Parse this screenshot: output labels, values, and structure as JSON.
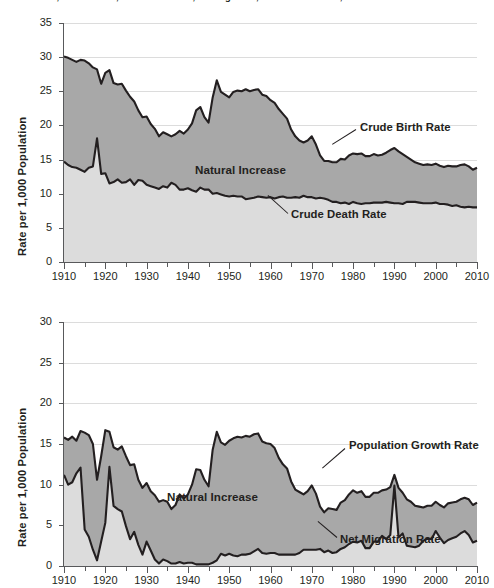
{
  "figure": {
    "title": "Crude Birth, Crude Death, Natural Increase, Net Migration, and Growth Rates, 1910–2010"
  },
  "panels": [
    {
      "id": "top",
      "ylabel": "Rate per 1,000 Population",
      "yticks": [
        "0",
        "5",
        "10",
        "15",
        "20",
        "25",
        "30",
        "35"
      ],
      "xticks": [
        "1910",
        "1920",
        "1930",
        "1940",
        "1950",
        "1960",
        "1970",
        "1980",
        "1990",
        "2000",
        "2010"
      ],
      "annotations": [
        {
          "name": "crude-birth-rate-label",
          "text": "Crude Birth Rate"
        },
        {
          "name": "natural-increase-label",
          "text": "Natural Increase"
        },
        {
          "name": "crude-death-rate-label",
          "text": "Crude Death Rate"
        }
      ]
    },
    {
      "id": "bottom",
      "ylabel": "Rate per 1,000 Population",
      "yticks": [
        "0",
        "5",
        "10",
        "15",
        "20",
        "25",
        "30"
      ],
      "xticks": [
        "1910",
        "1920",
        "1930",
        "1940",
        "1950",
        "1960",
        "1970",
        "1980",
        "1990",
        "2000",
        "2010"
      ],
      "annotations": [
        {
          "name": "population-growth-rate-label",
          "text": "Population Growth Rate"
        },
        {
          "name": "natural-increase-label",
          "text": "Natural Increase"
        },
        {
          "name": "net-migration-rate-label",
          "text": "Net Migration Rate"
        }
      ]
    }
  ],
  "colors": {
    "band_upper_fill": "#a8a8a8",
    "band_lower_fill": "#dcdcdc",
    "line": "#231f20",
    "grid": "#dcdcdc",
    "axis": "#58595b",
    "text": "#231f20"
  },
  "chart_data": [
    {
      "type": "area",
      "id": "top-panel",
      "title": "Crude Birth, Crude Death, Natural Increase, Net Migration, and Growth Rates, 1910–2010",
      "xlabel": "",
      "ylabel": "Rate per 1,000 Population",
      "xlim": [
        1910,
        2010
      ],
      "ylim": [
        0,
        35
      ],
      "ytick_step": 5,
      "xtick_step": 10,
      "xminor_tick_step": 5,
      "grid": true,
      "legend_position": "inline-annotations",
      "stacked": true,
      "shaded_regions": [
        {
          "name": "Natural Increase",
          "between": [
            "Crude Death Rate",
            "Crude Birth Rate"
          ],
          "fill": "#a8a8a8"
        },
        {
          "name": "Deaths",
          "between": [
            "zero",
            "Crude Death Rate"
          ],
          "fill": "#dcdcdc"
        }
      ],
      "x": [
        1910,
        1911,
        1912,
        1913,
        1914,
        1915,
        1916,
        1917,
        1918,
        1919,
        1920,
        1921,
        1922,
        1923,
        1924,
        1925,
        1926,
        1927,
        1928,
        1929,
        1930,
        1931,
        1932,
        1933,
        1934,
        1935,
        1936,
        1937,
        1938,
        1939,
        1940,
        1941,
        1942,
        1943,
        1944,
        1945,
        1946,
        1947,
        1948,
        1949,
        1950,
        1951,
        1952,
        1953,
        1954,
        1955,
        1956,
        1957,
        1958,
        1959,
        1960,
        1961,
        1962,
        1963,
        1964,
        1965,
        1966,
        1967,
        1968,
        1969,
        1970,
        1971,
        1972,
        1973,
        1974,
        1975,
        1976,
        1977,
        1978,
        1979,
        1980,
        1981,
        1982,
        1983,
        1984,
        1985,
        1986,
        1987,
        1988,
        1989,
        1990,
        1991,
        1992,
        1993,
        1994,
        1995,
        1996,
        1997,
        1998,
        1999,
        2000,
        2001,
        2002,
        2003,
        2004,
        2005,
        2006,
        2007,
        2008,
        2009,
        2010
      ],
      "series": [
        {
          "name": "Crude Birth Rate",
          "values": [
            30.1,
            29.9,
            29.6,
            29.3,
            29.6,
            29.5,
            29.1,
            28.5,
            28.2,
            26.1,
            27.7,
            28.1,
            26.2,
            26.0,
            26.1,
            25.1,
            24.2,
            23.5,
            22.2,
            21.2,
            21.3,
            20.2,
            19.5,
            18.4,
            19.0,
            18.7,
            18.4,
            18.7,
            19.2,
            18.8,
            19.4,
            20.3,
            22.2,
            22.7,
            21.2,
            20.4,
            24.1,
            26.6,
            24.9,
            24.5,
            24.1,
            24.9,
            25.1,
            25.0,
            25.3,
            25.0,
            25.2,
            25.3,
            24.5,
            24.3,
            23.7,
            23.3,
            22.4,
            21.7,
            21.0,
            19.4,
            18.4,
            17.8,
            17.5,
            17.8,
            18.4,
            17.2,
            15.6,
            14.8,
            14.8,
            14.6,
            14.6,
            15.1,
            15.0,
            15.6,
            15.9,
            15.8,
            15.9,
            15.5,
            15.5,
            15.8,
            15.6,
            15.7,
            16.0,
            16.4,
            16.7,
            16.2,
            15.8,
            15.4,
            15.0,
            14.6,
            14.4,
            14.2,
            14.3,
            14.2,
            14.4,
            14.1,
            13.9,
            14.1,
            14.0,
            14.0,
            14.2,
            14.3,
            14.0,
            13.5,
            13.8
          ]
        },
        {
          "name": "Crude Death Rate",
          "values": [
            14.7,
            14.2,
            13.9,
            13.8,
            13.5,
            13.2,
            13.8,
            14.0,
            18.1,
            12.9,
            13.0,
            11.5,
            11.7,
            12.1,
            11.6,
            11.7,
            12.1,
            11.3,
            12.0,
            11.9,
            11.3,
            11.1,
            10.9,
            10.7,
            11.1,
            10.9,
            11.6,
            11.3,
            10.6,
            10.6,
            10.8,
            10.5,
            10.3,
            10.9,
            10.6,
            10.6,
            10.0,
            10.1,
            9.9,
            9.7,
            9.6,
            9.7,
            9.6,
            9.6,
            9.2,
            9.3,
            9.4,
            9.6,
            9.5,
            9.4,
            9.5,
            9.3,
            9.5,
            9.6,
            9.4,
            9.4,
            9.5,
            9.4,
            9.7,
            9.5,
            9.5,
            9.3,
            9.4,
            9.3,
            9.1,
            8.8,
            8.8,
            8.6,
            8.7,
            8.5,
            8.8,
            8.6,
            8.5,
            8.6,
            8.6,
            8.7,
            8.7,
            8.7,
            8.8,
            8.7,
            8.6,
            8.6,
            8.5,
            8.8,
            8.8,
            8.8,
            8.7,
            8.6,
            8.6,
            8.6,
            8.7,
            8.5,
            8.5,
            8.4,
            8.2,
            8.3,
            8.1,
            8.0,
            8.1,
            8.0,
            8.0
          ]
        }
      ],
      "annotations": [
        {
          "text": "Crude Birth Rate",
          "at_year": 1985
        },
        {
          "text": "Natural Increase",
          "at_year": 1952
        },
        {
          "text": "Crude Death Rate",
          "at_year": 1984
        }
      ]
    },
    {
      "type": "area",
      "id": "bottom-panel",
      "title": "",
      "xlabel": "",
      "ylabel": "Rate per 1,000 Population",
      "xlim": [
        1910,
        2010
      ],
      "ylim": [
        0,
        30
      ],
      "ytick_step": 5,
      "xtick_step": 10,
      "xminor_tick_step": 5,
      "grid": true,
      "legend_position": "inline-annotations",
      "stacked": true,
      "shaded_regions": [
        {
          "name": "Natural Increase",
          "between": [
            "Net Migration Rate",
            "Population Growth Rate"
          ],
          "fill": "#a8a8a8"
        },
        {
          "name": "Net Migration",
          "between": [
            "zero",
            "Net Migration Rate"
          ],
          "fill": "#dcdcdc"
        }
      ],
      "x": [
        1910,
        1911,
        1912,
        1913,
        1914,
        1915,
        1916,
        1917,
        1918,
        1919,
        1920,
        1921,
        1922,
        1923,
        1924,
        1925,
        1926,
        1927,
        1928,
        1929,
        1930,
        1931,
        1932,
        1933,
        1934,
        1935,
        1936,
        1937,
        1938,
        1939,
        1940,
        1941,
        1942,
        1943,
        1944,
        1945,
        1946,
        1947,
        1948,
        1949,
        1950,
        1951,
        1952,
        1953,
        1954,
        1955,
        1956,
        1957,
        1958,
        1959,
        1960,
        1961,
        1962,
        1963,
        1964,
        1965,
        1966,
        1967,
        1968,
        1969,
        1970,
        1971,
        1972,
        1973,
        1974,
        1975,
        1976,
        1977,
        1978,
        1979,
        1980,
        1981,
        1982,
        1983,
        1984,
        1985,
        1986,
        1987,
        1988,
        1989,
        1990,
        1991,
        1992,
        1993,
        1994,
        1995,
        1996,
        1997,
        1998,
        1999,
        2000,
        2001,
        2002,
        2003,
        2004,
        2005,
        2006,
        2007,
        2008,
        2009,
        2010
      ],
      "series": [
        {
          "name": "Population Growth Rate",
          "values": [
            15.8,
            15.5,
            15.9,
            15.4,
            16.6,
            16.4,
            16.1,
            15.0,
            10.6,
            13.5,
            16.7,
            16.5,
            14.6,
            14.3,
            14.7,
            13.5,
            12.4,
            12.5,
            10.6,
            9.6,
            10.2,
            9.2,
            8.7,
            7.9,
            8.1,
            7.9,
            7.0,
            7.5,
            8.8,
            8.3,
            8.8,
            10.0,
            11.9,
            11.8,
            10.6,
            9.8,
            14.3,
            16.5,
            15.2,
            14.9,
            15.4,
            15.7,
            15.9,
            15.8,
            16.0,
            15.9,
            16.2,
            16.3,
            15.3,
            15.1,
            15.0,
            14.5,
            13.3,
            12.5,
            12.0,
            10.4,
            9.4,
            9.1,
            8.8,
            9.2,
            9.9,
            8.9,
            7.3,
            6.6,
            7.1,
            7.0,
            6.9,
            7.8,
            8.1,
            8.8,
            9.3,
            9.0,
            9.2,
            8.5,
            8.5,
            9.0,
            9.0,
            9.3,
            9.4,
            9.7,
            11.2,
            9.6,
            9.0,
            8.2,
            7.9,
            7.4,
            7.3,
            7.2,
            7.4,
            7.4,
            7.9,
            7.5,
            7.2,
            7.7,
            7.8,
            7.9,
            8.2,
            8.4,
            8.2,
            7.5,
            7.8
          ]
        },
        {
          "name": "Net Migration Rate",
          "values": [
            11.2,
            10.0,
            10.3,
            11.4,
            12.1,
            4.5,
            3.6,
            2.0,
            0.7,
            3.0,
            5.3,
            12.2,
            7.4,
            7.0,
            6.7,
            4.9,
            3.3,
            4.2,
            2.6,
            1.4,
            3.0,
            1.9,
            0.8,
            0.3,
            0.8,
            0.6,
            0.3,
            0.3,
            0.5,
            0.3,
            0.4,
            0.4,
            0.2,
            0.2,
            0.2,
            0.2,
            0.4,
            0.7,
            1.5,
            1.3,
            1.5,
            1.3,
            1.2,
            1.4,
            1.4,
            1.5,
            1.8,
            2.1,
            1.6,
            1.5,
            1.6,
            1.6,
            1.4,
            1.4,
            1.4,
            1.4,
            1.4,
            1.6,
            2.0,
            2.0,
            2.0,
            2.0,
            2.1,
            1.7,
            1.9,
            1.6,
            1.7,
            2.1,
            2.3,
            2.7,
            3.0,
            2.9,
            3.1,
            2.2,
            2.2,
            3.0,
            3.0,
            3.7,
            3.3,
            3.8,
            9.9,
            3.5,
            4.0,
            2.5,
            2.4,
            2.3,
            2.5,
            3.1,
            3.4,
            3.3,
            4.3,
            3.5,
            2.8,
            3.2,
            3.4,
            3.6,
            4.0,
            4.3,
            3.8,
            2.9,
            3.1
          ]
        }
      ],
      "annotations": [
        {
          "text": "Population Growth Rate",
          "at_year": 1980
        },
        {
          "text": "Natural Increase",
          "at_year": 1947
        },
        {
          "text": "Net Migration Rate",
          "at_year": 1983
        }
      ]
    }
  ]
}
